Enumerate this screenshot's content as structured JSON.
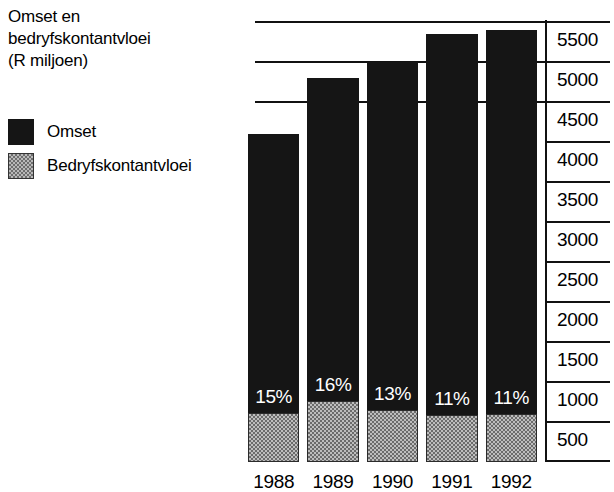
{
  "title": {
    "lines": [
      "Omset en",
      "bedryfskontantvloei",
      "(R miljoen)"
    ],
    "full": "Omset en bedryfskontantvloei (R miljoen)"
  },
  "legend": {
    "items": [
      {
        "label": "Omset",
        "swatch": "solid-black-swatch-icon",
        "color": "#151515"
      },
      {
        "label": "Bedryfskontantvloei",
        "swatch": "gray-stipple-swatch-icon",
        "color": "#bdbdbd"
      }
    ]
  },
  "chart_data": {
    "type": "bar",
    "title": "Omset en bedryfskontantvloei (R miljoen)",
    "xlabel": "",
    "ylabel": "R miljoen",
    "ylim": [
      0,
      5750
    ],
    "grid": true,
    "stacked": true,
    "legend_position": "left",
    "categories": [
      "1988",
      "1989",
      "1990",
      "1991",
      "1992"
    ],
    "ytick_labels": [
      "5500",
      "5000",
      "4500",
      "4000",
      "3500",
      "3000",
      "2500",
      "2000",
      "1500",
      "1000",
      "500"
    ],
    "ytick_values": [
      5500,
      5000,
      4500,
      4000,
      3500,
      3000,
      2500,
      2000,
      1500,
      1000,
      500
    ],
    "gridline_values": [
      5500,
      5000,
      4500
    ],
    "series": [
      {
        "name": "Omset",
        "values": [
          4100,
          4800,
          5000,
          5350,
          5400
        ],
        "color": "#151515"
      },
      {
        "name": "Bedryfskontantvloei",
        "values": [
          615,
          768,
          650,
          589,
          594
        ],
        "color": "#bdbdbd"
      }
    ],
    "data_labels": [
      "15%",
      "16%",
      "13%",
      "11%",
      "11%"
    ],
    "annotations": "Persentasie-etikette toon bedryfskontantvloei as persentasie van omset."
  },
  "bars": [
    {
      "year": "1988",
      "pct": "15%",
      "total": 4100,
      "cash": 615
    },
    {
      "year": "1989",
      "pct": "16%",
      "total": 4800,
      "cash": 768
    },
    {
      "year": "1990",
      "pct": "13%",
      "total": 5000,
      "cash": 650
    },
    {
      "year": "1991",
      "pct": "11%",
      "total": 5350,
      "cash": 589
    },
    {
      "year": "1992",
      "pct": "11%",
      "total": 5400,
      "cash": 594
    }
  ]
}
